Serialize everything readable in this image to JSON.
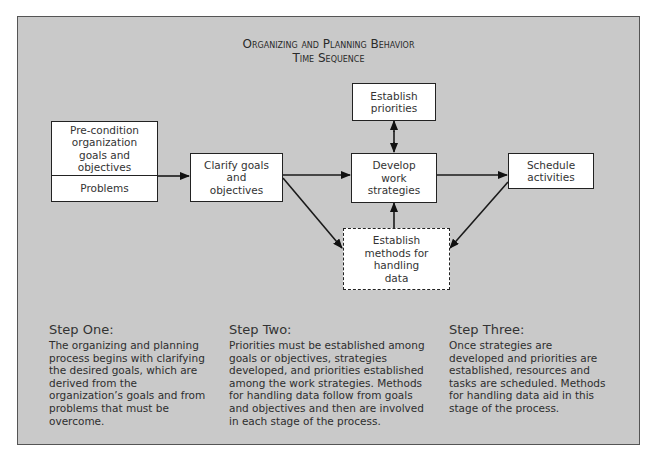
{
  "diagram": {
    "title_line1": "Organizing and Planning Behavior",
    "title_line2": "Time Sequence",
    "nodes": {
      "precondition": {
        "label": "Pre-condition organization goals and objectives",
        "sub_label": "Problems"
      },
      "clarify": {
        "label": "Clarify goals and objectives"
      },
      "priorities": {
        "label": "Establish priorities"
      },
      "develop": {
        "label": "Develop work strategies"
      },
      "methods": {
        "label": "Establish methods for handling data",
        "style": "dashed"
      },
      "schedule": {
        "label": "Schedule activities"
      }
    },
    "edges": [
      {
        "from": "precondition",
        "to": "clarify"
      },
      {
        "from": "clarify",
        "to": "develop"
      },
      {
        "from": "clarify",
        "to": "methods"
      },
      {
        "from": "priorities",
        "to": "develop",
        "bidirectional": true
      },
      {
        "from": "methods",
        "to": "develop"
      },
      {
        "from": "develop",
        "to": "schedule"
      },
      {
        "from": "schedule",
        "to": "methods"
      }
    ],
    "colors": {
      "panel": "#c9c9c9",
      "box": "#ffffff",
      "stroke": "#222222"
    }
  },
  "steps": [
    {
      "heading": "Step One:",
      "body": "The organizing and planning process begins with clarifying the desired goals, which are derived from the organization’s goals and from problems that must be overcome."
    },
    {
      "heading": "Step Two:",
      "body": "Priorities must be established among goals or objectives, strategies developed, and priorities established among the work strategies. Methods for handling data follow from goals and objectives and then are involved in each stage of the process."
    },
    {
      "heading": "Step Three:",
      "body": "Once strategies are developed and priorities are established, resources and tasks are scheduled. Methods for handling data aid in this stage of the process."
    }
  ]
}
